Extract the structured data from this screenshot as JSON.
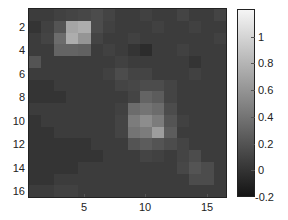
{
  "chart_data": {
    "type": "heatmap",
    "title": "",
    "xlabel": "",
    "ylabel": "",
    "x_ticks": [
      5,
      10,
      15
    ],
    "y_ticks": [
      2,
      4,
      6,
      8,
      10,
      12,
      14,
      16
    ],
    "x_range": [
      0.5,
      16.5
    ],
    "y_range": [
      0.5,
      16.5
    ],
    "colormap": "gray",
    "colorbar": {
      "ticks": [
        1,
        0.8,
        0.6,
        0.4,
        0.2,
        0,
        -0.2
      ],
      "range": [
        -0.2,
        1.2
      ]
    },
    "matrix": [
      [
        0.05,
        0.05,
        0.08,
        0.1,
        0.12,
        0.15,
        0.1,
        0.05,
        0.05,
        0.08,
        0.05,
        0.05,
        0.1,
        0.05,
        0.05,
        0.1
      ],
      [
        0.0,
        0.08,
        0.2,
        0.7,
        0.75,
        0.15,
        0.08,
        0.05,
        0.05,
        0.05,
        0.08,
        0.05,
        0.05,
        0.08,
        0.05,
        0.05
      ],
      [
        0.05,
        0.1,
        0.35,
        0.75,
        0.6,
        0.1,
        0.05,
        0.05,
        0.08,
        0.05,
        0.05,
        0.05,
        0.05,
        0.05,
        0.05,
        0.08
      ],
      [
        0.05,
        0.05,
        0.3,
        0.3,
        0.28,
        0.05,
        0.08,
        0.05,
        0.0,
        -0.05,
        0.05,
        0.05,
        0.08,
        0.05,
        0.05,
        0.05
      ],
      [
        0.2,
        0.05,
        0.05,
        0.05,
        0.05,
        0.05,
        0.05,
        0.08,
        0.05,
        0.05,
        0.05,
        0.05,
        0.05,
        0.0,
        0.05,
        0.05
      ],
      [
        0.05,
        0.05,
        0.05,
        0.05,
        0.05,
        0.05,
        0.08,
        0.15,
        0.1,
        0.1,
        0.05,
        0.05,
        0.05,
        0.08,
        0.05,
        0.05
      ],
      [
        0.0,
        0.0,
        0.05,
        0.05,
        0.05,
        0.05,
        0.05,
        0.1,
        0.12,
        0.15,
        0.15,
        0.1,
        0.05,
        0.05,
        0.05,
        0.05
      ],
      [
        0.0,
        0.0,
        0.0,
        0.05,
        0.05,
        0.05,
        0.05,
        0.05,
        0.1,
        0.3,
        0.25,
        0.1,
        0.05,
        0.05,
        0.05,
        0.05
      ],
      [
        0.05,
        0.05,
        0.05,
        0.05,
        0.05,
        0.05,
        0.05,
        0.08,
        0.35,
        0.4,
        0.35,
        0.15,
        0.05,
        0.05,
        0.05,
        0.05
      ],
      [
        0.0,
        0.05,
        0.05,
        0.05,
        0.05,
        0.05,
        0.05,
        0.1,
        0.45,
        0.55,
        0.45,
        0.2,
        0.08,
        0.05,
        0.05,
        0.05
      ],
      [
        0.0,
        0.0,
        0.05,
        0.05,
        0.05,
        0.05,
        0.05,
        0.1,
        0.4,
        0.45,
        0.65,
        0.25,
        0.05,
        0.05,
        0.05,
        0.05
      ],
      [
        0.0,
        0.0,
        0.0,
        0.0,
        0.0,
        0.05,
        0.05,
        0.05,
        0.2,
        0.25,
        0.2,
        0.15,
        0.1,
        0.05,
        0.05,
        0.05
      ],
      [
        0.0,
        0.0,
        0.0,
        0.0,
        0.0,
        0.0,
        0.05,
        0.05,
        0.05,
        0.1,
        0.08,
        0.05,
        0.1,
        0.15,
        0.05,
        0.05
      ],
      [
        0.0,
        0.0,
        0.0,
        0.0,
        0.05,
        0.05,
        0.05,
        0.05,
        0.05,
        0.05,
        0.05,
        0.05,
        0.12,
        0.2,
        0.15,
        0.05
      ],
      [
        0.0,
        0.0,
        0.05,
        0.05,
        0.05,
        0.05,
        0.05,
        0.05,
        0.05,
        0.05,
        0.05,
        0.05,
        0.05,
        0.15,
        0.15,
        0.05
      ],
      [
        0.05,
        0.05,
        0.08,
        0.08,
        0.05,
        0.05,
        0.05,
        0.05,
        0.05,
        0.05,
        0.05,
        0.05,
        0.05,
        0.05,
        0.05,
        0.05
      ]
    ],
    "grid": false,
    "legend": "colorbar-right"
  },
  "axes": {
    "y_tick_labels": [
      "2",
      "4",
      "6",
      "8",
      "10",
      "12",
      "14",
      "16"
    ],
    "x_tick_labels": [
      "5",
      "10",
      "15"
    ],
    "colorbar_tick_labels": [
      "1",
      "0.8",
      "0.6",
      "0.4",
      "0.2",
      "0",
      "-0.2"
    ]
  }
}
